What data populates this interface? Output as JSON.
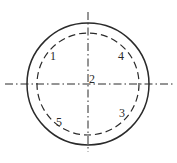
{
  "diagram": {
    "center": {
      "x": 88,
      "y": 84
    },
    "outer_circle": {
      "r": 61,
      "style": "solid"
    },
    "inner_circle": {
      "r": 51,
      "style": "dashed"
    },
    "centerlines": {
      "horizontal": {
        "x1": 5,
        "x2": 173
      },
      "vertical": {
        "y1": 12,
        "y2": 152
      },
      "style": "dash-dot"
    },
    "stroke_color": "#2a2a2a",
    "labels": [
      {
        "text": "1",
        "x": 53,
        "y": 56
      },
      {
        "text": "2",
        "x": 92,
        "y": 79
      },
      {
        "text": "3",
        "x": 122,
        "y": 113
      },
      {
        "text": "4",
        "x": 121,
        "y": 56
      },
      {
        "text": "5",
        "x": 59,
        "y": 122
      }
    ]
  }
}
